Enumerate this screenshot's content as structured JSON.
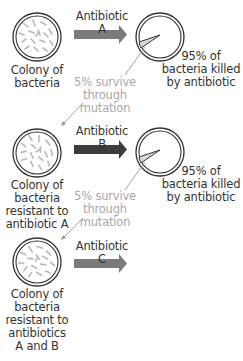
{
  "diagram": {
    "colors": {
      "arrow_a": "#7a7a7a",
      "arrow_b": "#3c3c3c",
      "arrow_c": "#7a7a7a",
      "circle_stroke": "#333333",
      "bacteria": "#b8b8b8",
      "connector": "#9a9a9a",
      "muted_text": "#a8a8a8",
      "text": "#333333"
    },
    "stages": [
      {
        "colony_label": [
          "Colony of",
          "bacteria"
        ],
        "arrow_label": "Antibiotic A",
        "result_label": [
          "95% of",
          "bacteria killed",
          "by antibiotic"
        ],
        "survive_label": [
          "5% survive",
          "through",
          "mutation"
        ]
      },
      {
        "colony_label": [
          "Colony of",
          "bacteria",
          "resistant to",
          "antibiotic A"
        ],
        "arrow_label": "Antibiotic B",
        "result_label": [
          "95% of",
          "bacteria killed",
          "by antibiotic"
        ],
        "survive_label": [
          "5% survive",
          "through",
          "mutation"
        ]
      },
      {
        "colony_label": [
          "Colony of",
          "bacteria",
          "resistant to",
          "antibiotics",
          "A and B"
        ],
        "arrow_label": "Antibiotic C"
      }
    ]
  }
}
